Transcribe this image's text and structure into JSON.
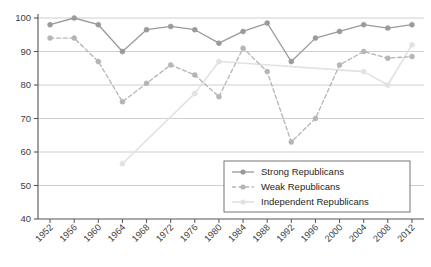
{
  "chart_data": {
    "type": "line",
    "title": "",
    "subtitle": "",
    "xlabel": "",
    "ylabel": "",
    "categories": [
      "1952",
      "1956",
      "1960",
      "1964",
      "1968",
      "1972",
      "1976",
      "1980",
      "1984",
      "1988",
      "1992",
      "1996",
      "2000",
      "2004",
      "2008",
      "2012"
    ],
    "xlim": [
      1950,
      2014
    ],
    "ylim": [
      40,
      100
    ],
    "yticks": [
      40,
      50,
      60,
      70,
      80,
      90,
      100
    ],
    "xticks": [
      "1952",
      "1956",
      "1960",
      "1964",
      "1968",
      "1972",
      "1976",
      "1980",
      "1984",
      "1988",
      "1992",
      "1996",
      "2000",
      "2004",
      "2008",
      "2012"
    ],
    "grid": "horizontal",
    "legend_position": "bottom-right",
    "series": [
      {
        "name": "Strong Republicans",
        "color": "#9a9a9a",
        "style": "solid",
        "marker": "circle",
        "values": [
          98,
          100,
          98,
          90,
          96.5,
          97.5,
          96.5,
          92.5,
          96,
          98.5,
          87,
          94,
          96,
          98,
          97,
          98
        ]
      },
      {
        "name": "Weak Republicans",
        "color": "#b5b5b5",
        "style": "dashed",
        "marker": "circle",
        "values": [
          94,
          94,
          87,
          75,
          80.5,
          86,
          83,
          76.5,
          91,
          84,
          63,
          70,
          86,
          90,
          88,
          88.5
        ]
      },
      {
        "name": "Independent Republicans",
        "color": "#e2e2e2",
        "style": "solid",
        "marker": "circle",
        "values": [
          null,
          null,
          null,
          56.5,
          null,
          null,
          77.5,
          87,
          null,
          null,
          null,
          null,
          null,
          84,
          80,
          92
        ]
      }
    ]
  },
  "legend": {
    "items": [
      {
        "label": "Strong Republicans",
        "color": "#9a9a9a",
        "style": "solid"
      },
      {
        "label": "Weak Republicans",
        "color": "#b5b5b5",
        "style": "dashed"
      },
      {
        "label": "Independent Republicans",
        "color": "#e2e2e2",
        "style": "solid"
      }
    ]
  },
  "axis": {
    "y_tick_labels": [
      "100",
      "90",
      "80",
      "70",
      "60",
      "50",
      "40"
    ],
    "x_tick_labels": [
      "1952",
      "1956",
      "1960",
      "1964",
      "1968",
      "1972",
      "1976",
      "1980",
      "1984",
      "1988",
      "1992",
      "1996",
      "2000",
      "2004",
      "2008",
      "2012"
    ]
  },
  "colors": {
    "axis": "#555555",
    "grid": "#c9c9c9",
    "background": "#ffffff",
    "strong": "#9a9a9a",
    "weak": "#b5b5b5",
    "independent": "#e2e2e2"
  }
}
